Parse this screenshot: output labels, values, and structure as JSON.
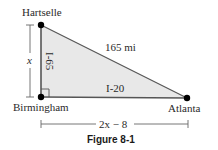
{
  "figure": {
    "caption": "Figure 8-1",
    "colors": {
      "fill": "#e8e8e8",
      "stroke": "#555555",
      "point": "#000000",
      "dimension": "#666666"
    },
    "points": {
      "hartselle": {
        "label": "Hartselle"
      },
      "birmingham": {
        "label": "Birmingham"
      },
      "atlanta": {
        "label": "Atlanta"
      }
    },
    "edges": {
      "hypotenuse": {
        "label": "165 mi"
      },
      "vertical": {
        "label": "I-65"
      },
      "horizontal": {
        "label": "I-20"
      }
    },
    "dimensions": {
      "vertical": {
        "label": "x"
      },
      "horizontal": {
        "label": "2x − 8"
      }
    }
  }
}
